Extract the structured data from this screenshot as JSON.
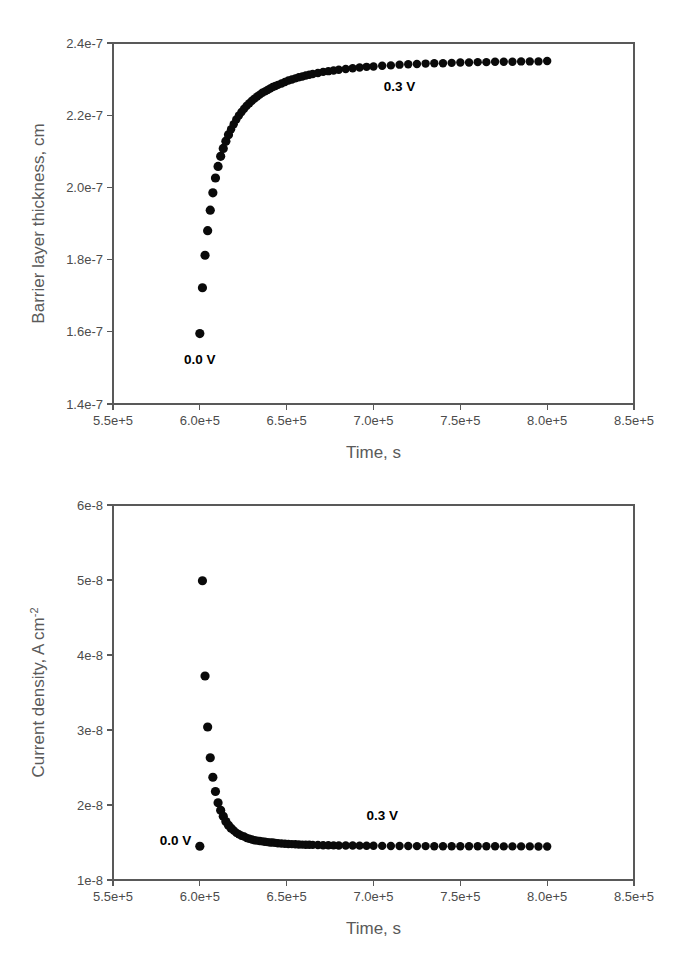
{
  "figure": {
    "background_color": "#ffffff",
    "marker_color": "#0a0a0a",
    "axis_color": "#595959",
    "label_color": "#5a5a5a"
  },
  "panels": {
    "top": {
      "ylabel": "Barrier layer thickness, cm",
      "xlabel": "Time, s",
      "y_ticks": [
        "1.4e-7",
        "1.6e-7",
        "1.8e-7",
        "2.0e-7",
        "2.2e-7",
        "2.4e-7"
      ],
      "x_ticks": [
        "5.5e+5",
        "6.0e+5",
        "6.5e+5",
        "7.0e+5",
        "7.5e+5",
        "8.0e+5",
        "8.5e+5"
      ],
      "annotations": [
        {
          "text": "0.0 V",
          "x": 600000,
          "y": 1.512e-07
        },
        {
          "text": "0.3 V",
          "x": 715000,
          "y": 2.268e-07
        }
      ]
    },
    "bottom": {
      "ylabel_main": "Current density, A cm",
      "ylabel_sup": "-2",
      "xlabel": "Time, s",
      "y_ticks": [
        "1e-8",
        "2e-8",
        "3e-8",
        "4e-8",
        "5e-8",
        "6e-8"
      ],
      "x_ticks": [
        "5.5e+5",
        "6.0e+5",
        "6.5e+5",
        "7.0e+5",
        "7.5e+5",
        "8.0e+5",
        "8.5e+5"
      ],
      "annotations": [
        {
          "text": "0.0 V",
          "x": 586000,
          "y": 1.47e-08
        },
        {
          "text": "0.3 V",
          "x": 705000,
          "y": 1.8e-08
        }
      ]
    }
  },
  "chart_data": [
    {
      "id": "barrier-layer-thickness",
      "type": "scatter",
      "title": "",
      "xlabel": "Time, s",
      "ylabel": "Barrier layer thickness, cm",
      "xlim": [
        550000,
        850000
      ],
      "ylim": [
        1.4e-07,
        2.4e-07
      ],
      "xticks": [
        550000,
        600000,
        650000,
        700000,
        750000,
        800000,
        850000
      ],
      "yticks": [
        1.4e-07,
        1.6e-07,
        1.8e-07,
        2e-07,
        2.2e-07,
        2.4e-07
      ],
      "grid": false,
      "legend": "none",
      "annotations": [
        {
          "text": "0.0 V",
          "x": 600000,
          "y": 1.512e-07
        },
        {
          "text": "0.3 V",
          "x": 715000,
          "y": 2.268e-07
        }
      ],
      "series": [
        {
          "name": "Barrier layer thickness",
          "marker": "filled-circle",
          "color": "#0a0a0a",
          "x": [
            600000,
            601500,
            603000,
            604500,
            606000,
            607500,
            609000,
            610500,
            612000,
            613500,
            615000,
            616500,
            618000,
            619500,
            621000,
            622500,
            624000,
            625500,
            627000,
            628500,
            630000,
            631500,
            633000,
            634500,
            636000,
            637500,
            639000,
            640500,
            642000,
            643500,
            645000,
            647000,
            649000,
            651000,
            653000,
            655000,
            657000,
            659000,
            661000,
            663000,
            665000,
            668000,
            671000,
            674000,
            677000,
            680000,
            684000,
            688000,
            692000,
            696000,
            700000,
            705000,
            710000,
            715000,
            720000,
            725000,
            730000,
            735000,
            740000,
            745000,
            750000,
            755000,
            760000,
            765000,
            770000,
            775000,
            780000,
            785000,
            790000,
            795000,
            800000
          ],
          "y": [
            1.595e-07,
            1.722e-07,
            1.812e-07,
            1.88e-07,
            1.937e-07,
            1.985e-07,
            2.026e-07,
            2.058e-07,
            2.086e-07,
            2.108e-07,
            2.128e-07,
            2.146e-07,
            2.161e-07,
            2.175e-07,
            2.188e-07,
            2.199e-07,
            2.209e-07,
            2.218e-07,
            2.226e-07,
            2.233e-07,
            2.24e-07,
            2.246e-07,
            2.252e-07,
            2.257e-07,
            2.262e-07,
            2.266e-07,
            2.27e-07,
            2.274e-07,
            2.278e-07,
            2.281e-07,
            2.284e-07,
            2.288e-07,
            2.292e-07,
            2.296e-07,
            2.299e-07,
            2.302e-07,
            2.305e-07,
            2.307e-07,
            2.31e-07,
            2.312e-07,
            2.314e-07,
            2.317e-07,
            2.32e-07,
            2.322e-07,
            2.324e-07,
            2.326e-07,
            2.328e-07,
            2.33e-07,
            2.332e-07,
            2.334e-07,
            2.335e-07,
            2.337e-07,
            2.338e-07,
            2.34e-07,
            2.341e-07,
            2.342e-07,
            2.343e-07,
            2.344e-07,
            2.344e-07,
            2.345e-07,
            2.346e-07,
            2.346e-07,
            2.347e-07,
            2.347e-07,
            2.348e-07,
            2.348e-07,
            2.348e-07,
            2.349e-07,
            2.349e-07,
            2.349e-07,
            2.35e-07
          ]
        }
      ]
    },
    {
      "id": "current-density",
      "type": "scatter",
      "title": "",
      "xlabel": "Time, s",
      "ylabel": "Current density, A cm-2",
      "xlim": [
        550000,
        850000
      ],
      "ylim": [
        1e-08,
        6e-08
      ],
      "xticks": [
        550000,
        600000,
        650000,
        700000,
        750000,
        800000,
        850000
      ],
      "yticks": [
        1e-08,
        2e-08,
        3e-08,
        4e-08,
        5e-08,
        6e-08
      ],
      "grid": false,
      "legend": "none",
      "annotations": [
        {
          "text": "0.0 V",
          "x": 586000,
          "y": 1.47e-08
        },
        {
          "text": "0.3 V",
          "x": 705000,
          "y": 1.8e-08
        }
      ],
      "series": [
        {
          "name": "Current density (0.0 V baseline point)",
          "marker": "filled-circle",
          "color": "#0a0a0a",
          "x": [
            600000
          ],
          "y": [
            1.45e-08
          ]
        },
        {
          "name": "Current density (0.3 V step)",
          "marker": "filled-circle",
          "color": "#0a0a0a",
          "x": [
            601500,
            603000,
            604500,
            606000,
            607500,
            609000,
            610500,
            612000,
            613500,
            615000,
            616500,
            618000,
            619500,
            621000,
            622500,
            624000,
            625500,
            627000,
            628500,
            630000,
            631500,
            633000,
            634500,
            636000,
            637500,
            639000,
            640500,
            642000,
            643500,
            645000,
            647000,
            649000,
            651000,
            653000,
            655000,
            657000,
            659000,
            661000,
            663000,
            665000,
            668000,
            671000,
            674000,
            677000,
            680000,
            684000,
            688000,
            692000,
            696000,
            700000,
            705000,
            710000,
            715000,
            720000,
            725000,
            730000,
            735000,
            740000,
            745000,
            750000,
            755000,
            760000,
            765000,
            770000,
            775000,
            780000,
            785000,
            790000,
            795000,
            800000
          ],
          "y": [
            4.99e-08,
            3.72e-08,
            3.04e-08,
            2.63e-08,
            2.37e-08,
            2.18e-08,
            2.03e-08,
            1.93e-08,
            1.85e-08,
            1.78e-08,
            1.73e-08,
            1.69e-08,
            1.66e-08,
            1.63e-08,
            1.61e-08,
            1.59e-08,
            1.58e-08,
            1.56e-08,
            1.55e-08,
            1.54e-08,
            1.53e-08,
            1.525e-08,
            1.52e-08,
            1.515e-08,
            1.51e-08,
            1.505e-08,
            1.5e-08,
            1.5e-08,
            1.495e-08,
            1.49e-08,
            1.487e-08,
            1.484e-08,
            1.481e-08,
            1.478e-08,
            1.476e-08,
            1.474e-08,
            1.472e-08,
            1.47e-08,
            1.469e-08,
            1.468e-08,
            1.466e-08,
            1.464e-08,
            1.463e-08,
            1.462e-08,
            1.461e-08,
            1.46e-08,
            1.459e-08,
            1.458e-08,
            1.457e-08,
            1.456e-08,
            1.455e-08,
            1.454e-08,
            1.453e-08,
            1.453e-08,
            1.452e-08,
            1.452e-08,
            1.451e-08,
            1.451e-08,
            1.45e-08,
            1.45e-08,
            1.45e-08,
            1.449e-08,
            1.449e-08,
            1.449e-08,
            1.448e-08,
            1.448e-08,
            1.448e-08,
            1.448e-08,
            1.447e-08,
            1.447e-08
          ]
        }
      ]
    }
  ]
}
